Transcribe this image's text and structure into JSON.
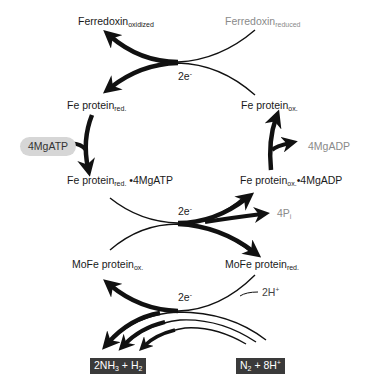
{
  "diagram": {
    "nodes": {
      "ferredoxin_ox": {
        "main": "Ferredoxin",
        "sub": "oxidized"
      },
      "ferredoxin_red": {
        "main": "Ferredoxin",
        "sub": "reduced"
      },
      "fe_red": {
        "main": "Fe protein",
        "sub": "red."
      },
      "fe_ox": {
        "main": "Fe protein",
        "sub": "ox."
      },
      "atp_in": {
        "main": "4MgATP"
      },
      "adp_out": {
        "main": "4MgADP"
      },
      "fe_red_atp": {
        "main": "Fe protein",
        "sub": "red.",
        "suffix": " •4MgATP"
      },
      "fe_ox_adp": {
        "main": "Fe protein",
        "sub": "ox.",
        "suffix": "•4MgADP"
      },
      "pi_out": {
        "main": "4P",
        "sub": "i"
      },
      "mofe_ox": {
        "main": "MoFe protein",
        "sub": "ox."
      },
      "mofe_red": {
        "main": "MoFe protein",
        "sub": "red."
      },
      "h_in": {
        "main": "2H",
        "sup": "+"
      },
      "products": {
        "a": "2NH",
        "a_sub": "3",
        "b": " + H",
        "b_sub": "2"
      },
      "substrates": {
        "a": "N",
        "a_sub": "2",
        "b": " + 8H",
        "b_sup": "+"
      }
    },
    "electron_labels": [
      {
        "main": "2e",
        "sup": "-"
      },
      {
        "main": "2e",
        "sup": "-"
      },
      {
        "main": "2e",
        "sup": "-"
      }
    ],
    "colors": {
      "arrow": "#111111",
      "reagent_text": "#8a8a8a",
      "atp_pill": "#d6d6d6",
      "product_box": "#3a3a3a"
    }
  }
}
